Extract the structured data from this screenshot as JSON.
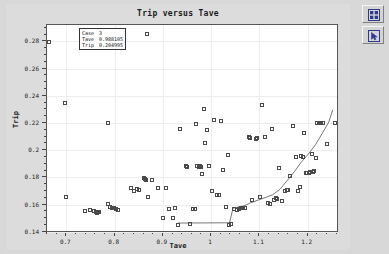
{
  "window": {
    "background_color": "#d8d8d8",
    "plot_background_color": "#ffffff"
  },
  "toolbar": {
    "buttons": [
      {
        "name": "tile-windows-icon",
        "label": "Tile Windows"
      },
      {
        "name": "pointer-tool-icon",
        "label": "Pointer Tool"
      }
    ]
  },
  "info_box": {
    "rows": [
      {
        "key": "Case",
        "value": "3"
      },
      {
        "key": "Tave",
        "value": "0.988105"
      },
      {
        "key": "Trip",
        "value": "0.204995"
      }
    ]
  },
  "chart_data": {
    "type": "scatter",
    "title": "Trip versus Tave",
    "xlabel": "Tave",
    "ylabel": "Trip",
    "xlim": [
      0.66,
      1.265
    ],
    "ylim": [
      0.139,
      0.292
    ],
    "xticks": [
      0.7,
      0.8,
      0.9,
      1.0,
      1.1,
      1.2
    ],
    "xtick_labels": [
      "0.7",
      "0.8",
      "0.9",
      "1",
      "1.1",
      "1.2"
    ],
    "yticks": [
      0.14,
      0.16,
      0.18,
      0.2,
      0.22,
      0.24,
      0.26,
      0.28
    ],
    "ytick_labels": [
      "0.14",
      "0.16",
      "0.18",
      "0.2",
      "0.22",
      "0.24",
      "0.26",
      "0.28"
    ],
    "x_minor_step": 0.02,
    "y_minor_step": 0.005,
    "grid": true,
    "legend": null,
    "marker": "open-square",
    "marker_color": "#4a4a4a",
    "series": [
      {
        "name": "Cases",
        "points": [
          [
            0.665,
            0.2795
          ],
          [
            0.697,
            0.2347
          ],
          [
            0.7,
            0.1655
          ],
          [
            0.739,
            0.1551
          ],
          [
            0.749,
            0.1556
          ],
          [
            0.757,
            0.1551
          ],
          [
            0.761,
            0.1545
          ],
          [
            0.764,
            0.1539
          ],
          [
            0.766,
            0.1542
          ],
          [
            0.768,
            0.1545
          ],
          [
            0.786,
            0.2198
          ],
          [
            0.787,
            0.1606
          ],
          [
            0.791,
            0.1583
          ],
          [
            0.795,
            0.1571
          ],
          [
            0.799,
            0.1574
          ],
          [
            0.802,
            0.1568
          ],
          [
            0.808,
            0.1556
          ],
          [
            0.833,
            0.1718
          ],
          [
            0.841,
            0.1697
          ],
          [
            0.846,
            0.1712
          ],
          [
            0.851,
            0.1709
          ],
          [
            0.86,
            0.1795
          ],
          [
            0.862,
            0.1789
          ],
          [
            0.866,
            0.1783
          ],
          [
            0.868,
            0.2852
          ],
          [
            0.869,
            0.1653
          ],
          [
            0.877,
            0.178
          ],
          [
            0.89,
            0.1723
          ],
          [
            0.9,
            0.1498
          ],
          [
            0.906,
            0.1724
          ],
          [
            0.912,
            0.1568
          ],
          [
            0.921,
            0.1498
          ],
          [
            0.925,
            0.1572
          ],
          [
            0.932,
            0.1449
          ],
          [
            0.935,
            0.2157
          ],
          [
            0.947,
            0.1882
          ],
          [
            0.951,
            0.1876
          ],
          [
            0.957,
            0.1459
          ],
          [
            0.963,
            0.1566
          ],
          [
            0.966,
            0.157
          ],
          [
            0.968,
            0.2189
          ],
          [
            0.97,
            0.1881
          ],
          [
            0.975,
            0.1879
          ],
          [
            0.977,
            0.1883
          ],
          [
            0.979,
            0.1877
          ],
          [
            0.982,
            0.1825
          ],
          [
            0.985,
            0.2303
          ],
          [
            0.988,
            0.205
          ],
          [
            0.991,
            0.2148
          ],
          [
            0.996,
            0.188
          ],
          [
            1.001,
            0.17
          ],
          [
            1.006,
            0.2225
          ],
          [
            1.012,
            0.1673
          ],
          [
            1.016,
            0.1668
          ],
          [
            1.021,
            0.2216
          ],
          [
            1.025,
            0.1857
          ],
          [
            1.031,
            0.1583
          ],
          [
            1.034,
            0.1965
          ],
          [
            1.038,
            0.1451
          ],
          [
            1.041,
            0.1453
          ],
          [
            1.048,
            0.1565
          ],
          [
            1.053,
            0.1563
          ],
          [
            1.057,
            0.1566
          ],
          [
            1.062,
            0.1572
          ],
          [
            1.066,
            0.1575
          ],
          [
            1.071,
            0.1577
          ],
          [
            1.079,
            0.2093
          ],
          [
            1.081,
            0.2091
          ],
          [
            1.085,
            0.1633
          ],
          [
            1.092,
            0.2085
          ],
          [
            1.096,
            0.2087
          ],
          [
            1.101,
            0.1657
          ],
          [
            1.106,
            0.2334
          ],
          [
            1.112,
            0.2094
          ],
          [
            1.117,
            0.1612
          ],
          [
            1.122,
            0.1607
          ],
          [
            1.127,
            0.2155
          ],
          [
            1.131,
            0.1635
          ],
          [
            1.134,
            0.1646
          ],
          [
            1.137,
            0.1644
          ],
          [
            1.141,
            0.1867
          ],
          [
            1.146,
            0.1627
          ],
          [
            1.152,
            0.1701
          ],
          [
            1.157,
            0.1706
          ],
          [
            1.16,
            0.1703
          ],
          [
            1.164,
            0.1808
          ],
          [
            1.17,
            0.2174
          ],
          [
            1.176,
            0.1951
          ],
          [
            1.18,
            0.1698
          ],
          [
            1.184,
            0.1727
          ],
          [
            1.186,
            0.1955
          ],
          [
            1.19,
            0.1951
          ],
          [
            1.193,
            0.2128
          ],
          [
            1.196,
            0.1832
          ],
          [
            1.199,
            0.183
          ],
          [
            1.202,
            0.1834
          ],
          [
            1.205,
            0.1836
          ],
          [
            1.208,
            0.1972
          ],
          [
            1.211,
            0.184
          ],
          [
            1.214,
            0.1846
          ],
          [
            1.217,
            0.194
          ],
          [
            1.22,
            0.22
          ],
          [
            1.224,
            0.2198
          ],
          [
            1.227,
            0.2201
          ],
          [
            1.231,
            0.2199
          ],
          [
            1.24,
            0.2044
          ],
          [
            1.256,
            0.2199
          ]
        ]
      }
    ],
    "trend_line": {
      "name": "Lower envelope",
      "color": "#555555",
      "points": [
        [
          0.932,
          0.1449
        ],
        [
          1.038,
          0.1451
        ],
        [
          1.041,
          0.1453
        ],
        [
          1.048,
          0.156
        ],
        [
          1.053,
          0.1563
        ],
        [
          1.062,
          0.157
        ],
        [
          1.071,
          0.1577
        ],
        [
          1.085,
          0.16
        ],
        [
          1.101,
          0.162
        ],
        [
          1.117,
          0.164
        ],
        [
          1.131,
          0.166
        ],
        [
          1.146,
          0.17
        ],
        [
          1.16,
          0.176
        ],
        [
          1.176,
          0.183
        ],
        [
          1.19,
          0.19
        ],
        [
          1.205,
          0.196
        ],
        [
          1.22,
          0.203
        ],
        [
          1.235,
          0.212
        ],
        [
          1.248,
          0.22
        ],
        [
          1.256,
          0.229
        ]
      ]
    }
  }
}
